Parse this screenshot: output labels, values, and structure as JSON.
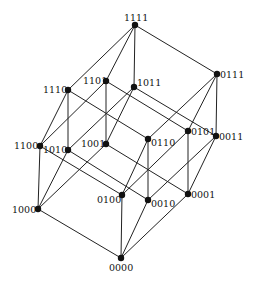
{
  "colors": {
    "edge": "#222222",
    "node": "#111111",
    "label": "#111111",
    "background": "#ffffff"
  },
  "nodes": [
    {
      "id": "1111",
      "x": 135,
      "y": 25,
      "lx": 124,
      "ly": 21,
      "anchor": "start"
    },
    {
      "id": "1110",
      "x": 68,
      "y": 90,
      "lx": 43,
      "ly": 93,
      "anchor": "start"
    },
    {
      "id": "1101",
      "x": 106,
      "y": 81,
      "lx": 83,
      "ly": 84,
      "anchor": "start"
    },
    {
      "id": "1011",
      "x": 134,
      "y": 87,
      "lx": 137,
      "ly": 86,
      "anchor": "start"
    },
    {
      "id": "0111",
      "x": 217,
      "y": 74,
      "lx": 220,
      "ly": 78,
      "anchor": "start"
    },
    {
      "id": "1100",
      "x": 40,
      "y": 146,
      "lx": 14,
      "ly": 149,
      "anchor": "start"
    },
    {
      "id": "1010",
      "x": 68,
      "y": 150,
      "lx": 43,
      "ly": 153,
      "anchor": "start"
    },
    {
      "id": "1001",
      "x": 106,
      "y": 144,
      "lx": 81,
      "ly": 147,
      "anchor": "start"
    },
    {
      "id": "0110",
      "x": 148,
      "y": 139,
      "lx": 151,
      "ly": 146,
      "anchor": "start"
    },
    {
      "id": "0101",
      "x": 188,
      "y": 131,
      "lx": 191,
      "ly": 135,
      "anchor": "start"
    },
    {
      "id": "0011",
      "x": 216,
      "y": 136,
      "lx": 219,
      "ly": 140,
      "anchor": "start"
    },
    {
      "id": "1000",
      "x": 38,
      "y": 209,
      "lx": 12,
      "ly": 213,
      "anchor": "start"
    },
    {
      "id": "0100",
      "x": 122,
      "y": 195,
      "lx": 97,
      "ly": 203,
      "anchor": "start"
    },
    {
      "id": "0010",
      "x": 148,
      "y": 200,
      "lx": 151,
      "ly": 207,
      "anchor": "start"
    },
    {
      "id": "0001",
      "x": 188,
      "y": 194,
      "lx": 191,
      "ly": 198,
      "anchor": "start"
    },
    {
      "id": "0000",
      "x": 121,
      "y": 258,
      "lx": 109,
      "ly": 271,
      "anchor": "start"
    }
  ],
  "edges": [
    [
      "1111",
      "1110"
    ],
    [
      "1111",
      "1101"
    ],
    [
      "1111",
      "1011"
    ],
    [
      "1111",
      "0111"
    ],
    [
      "1110",
      "1100"
    ],
    [
      "1110",
      "1010"
    ],
    [
      "1110",
      "0110"
    ],
    [
      "1101",
      "1100"
    ],
    [
      "1101",
      "1001"
    ],
    [
      "1101",
      "0101"
    ],
    [
      "1011",
      "1010"
    ],
    [
      "1011",
      "1001"
    ],
    [
      "1011",
      "0011"
    ],
    [
      "0111",
      "0110"
    ],
    [
      "0111",
      "0101"
    ],
    [
      "0111",
      "0011"
    ],
    [
      "1100",
      "1000"
    ],
    [
      "1100",
      "0100"
    ],
    [
      "1010",
      "1000"
    ],
    [
      "1010",
      "0010"
    ],
    [
      "1001",
      "1000"
    ],
    [
      "1001",
      "0001"
    ],
    [
      "0110",
      "0100"
    ],
    [
      "0110",
      "0010"
    ],
    [
      "0101",
      "0100"
    ],
    [
      "0101",
      "0001"
    ],
    [
      "0011",
      "0010"
    ],
    [
      "0011",
      "0001"
    ],
    [
      "1000",
      "0000"
    ],
    [
      "0100",
      "0000"
    ],
    [
      "0010",
      "0000"
    ],
    [
      "0001",
      "0000"
    ]
  ]
}
